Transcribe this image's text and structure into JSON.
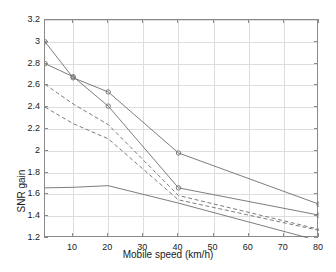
{
  "chart_data": {
    "type": "line",
    "title": "",
    "xlabel": "Mobile speed (km/h)",
    "ylabel": "SNR gain",
    "xlim": [
      2,
      80
    ],
    "ylim": [
      1.2,
      3.2
    ],
    "xticks": [
      10,
      20,
      30,
      40,
      50,
      60,
      70,
      80
    ],
    "yticks": [
      1.2,
      1.4,
      1.6,
      1.8,
      2,
      2.2,
      2.4,
      2.6,
      2.8,
      3,
      3.2
    ],
    "xtick_labels": [
      "10",
      "20",
      "30",
      "40",
      "50",
      "60",
      "70",
      "80"
    ],
    "ytick_labels": [
      "1.2",
      "1.4",
      "1.6",
      "1.8",
      "2",
      "2.2",
      "2.4",
      "2.6",
      "2.8",
      "3",
      "3.2"
    ],
    "grid": true,
    "legend": "none",
    "line_color": "#6e6e6e",
    "marker_color": "#6e6e6e",
    "axis_color": "#8a8a8a",
    "grid_color": "#dddddd",
    "background": "#ffffff",
    "series": [
      {
        "name": "solid-upper-circles",
        "style": "solid",
        "marker": "circle",
        "x": [
          2,
          10,
          20,
          40,
          80
        ],
        "values": [
          3.0,
          2.67,
          2.54,
          1.98,
          1.51
        ]
      },
      {
        "name": "solid-lower-circles",
        "style": "solid",
        "marker": "circle",
        "x": [
          2,
          10,
          20,
          40,
          80
        ],
        "values": [
          2.8,
          2.68,
          2.41,
          1.66,
          1.41
        ]
      },
      {
        "name": "dashed-upper",
        "style": "dashed",
        "marker": "none",
        "x": [
          2,
          10,
          20,
          40,
          80
        ],
        "values": [
          2.61,
          2.43,
          2.24,
          1.59,
          1.28
        ]
      },
      {
        "name": "dashed-lower",
        "style": "dashed",
        "marker": "none",
        "x": [
          2,
          10,
          20,
          40,
          80
        ],
        "values": [
          2.4,
          2.25,
          2.11,
          1.55,
          1.27
        ]
      },
      {
        "name": "solid-flat",
        "style": "solid",
        "marker": "none",
        "x": [
          2,
          10,
          20,
          40,
          77
        ],
        "values": [
          1.66,
          1.665,
          1.68,
          1.52,
          1.2
        ]
      }
    ]
  }
}
